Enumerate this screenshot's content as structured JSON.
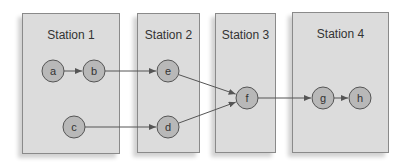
{
  "stations": [
    {
      "label": "Station 1",
      "x": 22,
      "y": 13,
      "w": 98,
      "h": 141
    },
    {
      "label": "Station 2",
      "x": 137,
      "y": 13,
      "w": 63,
      "h": 140
    },
    {
      "label": "Station 3",
      "x": 215,
      "y": 13,
      "w": 61,
      "h": 140
    },
    {
      "label": "Station 4",
      "x": 292,
      "y": 12,
      "w": 97,
      "h": 141
    }
  ],
  "nodes": [
    {
      "id": "a",
      "label": "a",
      "cx": 53,
      "cy": 71
    },
    {
      "id": "b",
      "label": "b",
      "cx": 94,
      "cy": 71
    },
    {
      "id": "e",
      "label": "e",
      "cx": 168,
      "cy": 71
    },
    {
      "id": "c",
      "label": "c",
      "cx": 74,
      "cy": 127
    },
    {
      "id": "d",
      "label": "d",
      "cx": 168,
      "cy": 127
    },
    {
      "id": "f",
      "label": "f",
      "cx": 247,
      "cy": 98
    },
    {
      "id": "g",
      "label": "g",
      "cx": 323,
      "cy": 98
    },
    {
      "id": "h",
      "label": "h",
      "cx": 360,
      "cy": 98
    }
  ],
  "edges": [
    {
      "from": "a",
      "to": "b"
    },
    {
      "from": "b",
      "to": "e"
    },
    {
      "from": "c",
      "to": "d"
    },
    {
      "from": "e",
      "to": "f"
    },
    {
      "from": "d",
      "to": "f"
    },
    {
      "from": "f",
      "to": "g"
    },
    {
      "from": "g",
      "to": "h"
    }
  ],
  "colors": {
    "box": "#dcdcdc",
    "node": "#b8b8b8",
    "stroke": "#555555"
  }
}
